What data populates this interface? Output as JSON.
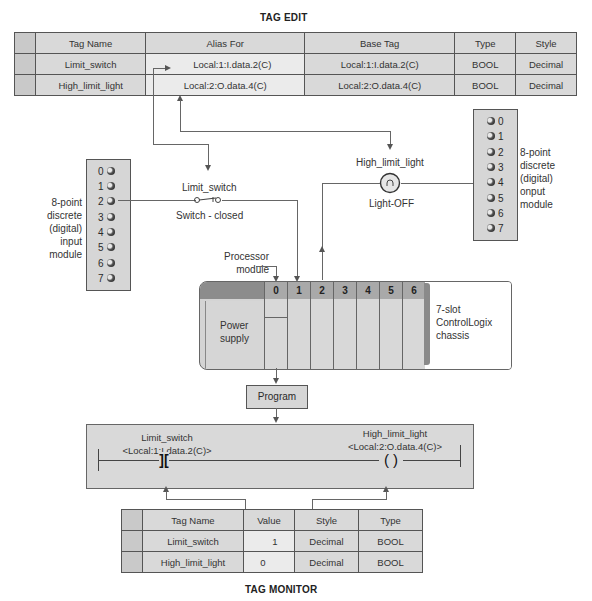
{
  "tag_edit": {
    "title": "TAG EDIT",
    "columns": [
      "Tag Name",
      "Alias For",
      "Base Tag",
      "Type",
      "Style"
    ],
    "rows": [
      {
        "tag_name": "Limit_switch",
        "alias_for": "Local:1:I.data.2(C)",
        "base_tag": "Local:1:I.data.2(C)",
        "type": "BOOL",
        "style": "Decimal"
      },
      {
        "tag_name": "High_limit_light",
        "alias_for": "Local:2:O.data.4(C)",
        "base_tag": "Local:2:O.data.4(C)",
        "type": "BOOL",
        "style": "Decimal"
      }
    ]
  },
  "input_module": {
    "label_lines": [
      "8-point",
      "discrete",
      "(digital)",
      "input",
      "module"
    ],
    "points": [
      "0",
      "1",
      "2",
      "3",
      "4",
      "5",
      "6",
      "7"
    ]
  },
  "output_module": {
    "label_lines": [
      "8-point",
      "discrete",
      "(digital)",
      "onput",
      "module"
    ],
    "points": [
      "0",
      "1",
      "2",
      "3",
      "4",
      "5",
      "6",
      "7"
    ]
  },
  "field_devices": {
    "switch_name": "Limit_switch",
    "switch_state": "Switch - closed",
    "light_name": "High_limit_light",
    "light_state": "Light-OFF"
  },
  "chassis": {
    "processor_label_lines": [
      "Processor",
      "module"
    ],
    "power_supply_lines": [
      "Power",
      "supply"
    ],
    "slots": [
      "0",
      "1",
      "2",
      "3",
      "4",
      "5",
      "6"
    ],
    "label_lines": [
      "7-slot",
      "ControlLogix",
      "chassis"
    ]
  },
  "program": {
    "label": "Program"
  },
  "ladder": {
    "contact_tag": "Limit_switch",
    "contact_address": "<Local:1:I.data.2(C)>",
    "contact_symbol": "][",
    "coil_tag": "High_limit_light",
    "coil_address": "<Local:2:O.data.4(C)>",
    "coil_symbol": "( )"
  },
  "tag_monitor": {
    "title": "TAG MONITOR",
    "columns": [
      "Tag Name",
      "Value",
      "Style",
      "Type"
    ],
    "rows": [
      {
        "tag_name": "Limit_switch",
        "value": "1",
        "style": "Decimal",
        "type": "BOOL"
      },
      {
        "tag_name": "High_limit_light",
        "value": "0",
        "style": "Decimal",
        "type": "BOOL"
      }
    ]
  }
}
